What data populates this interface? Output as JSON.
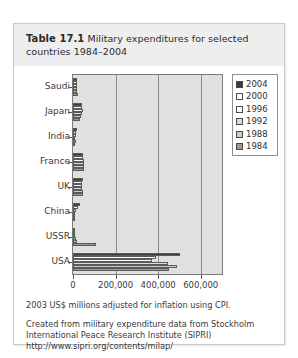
{
  "card": {
    "title_label": "Table 17.1",
    "title_text": "Military expenditures for selected countries 1984–2004"
  },
  "footer": {
    "note": "2003 US$ millions adjusted for inflation using CPI.",
    "source_line1": "Created from military expenditure data from Stockholm",
    "source_line2": "International Peace Research Institute (SIPRI)",
    "url": "http://www.sipri.org/contents/milap/"
  },
  "legend": {
    "position": "right",
    "entries": [
      {
        "label": "2004",
        "color": "#3a3a3a"
      },
      {
        "label": "2000",
        "color": "#ffffff"
      },
      {
        "label": "1996",
        "color": "#fbfbfb"
      },
      {
        "label": "1992",
        "color": "#dcdcdc"
      },
      {
        "label": "1988",
        "color": "#cdcdcd"
      },
      {
        "label": "1984",
        "color": "#9a9a9a"
      }
    ]
  },
  "chart_data": {
    "type": "bar",
    "orientation": "horizontal",
    "title": "Military expenditures for selected countries 1984–2004",
    "xlabel": "2003 US$ millions adjusted for inflation using CPI.",
    "ylabel": "",
    "xlim": [
      0,
      700000
    ],
    "xticks": [
      0,
      200000,
      400000,
      600000
    ],
    "xtick_labels": [
      "0",
      "200,000",
      "400,000",
      "600,000"
    ],
    "grid": true,
    "categories": [
      "Saudi",
      "Japan",
      "India",
      "France",
      "UK",
      "China",
      "USSR",
      "USA"
    ],
    "series": [
      {
        "name": "2004",
        "color": "#3a3a3a",
        "values": [
          19000,
          42000,
          19000,
          46000,
          47000,
          35000,
          0,
          505000
        ]
      },
      {
        "name": "2000",
        "color": "#ffffff",
        "values": [
          20000,
          44000,
          15000,
          47000,
          42000,
          22000,
          0,
          390000
        ]
      },
      {
        "name": "1996",
        "color": "#fbfbfb",
        "values": [
          17000,
          45000,
          12000,
          52000,
          41000,
          15000,
          0,
          370000
        ]
      },
      {
        "name": "1992",
        "color": "#dcdcdc",
        "values": [
          17000,
          42000,
          11000,
          53000,
          44000,
          11000,
          12000,
          445000
        ]
      },
      {
        "name": "1988",
        "color": "#cdcdcd",
        "values": [
          18000,
          38000,
          12000,
          53000,
          46000,
          9000,
          20000,
          490000
        ]
      },
      {
        "name": "1984",
        "color": "#9a9a9a",
        "values": [
          22000,
          33000,
          10000,
          52000,
          47000,
          10000,
          110000,
          450000
        ]
      }
    ]
  }
}
